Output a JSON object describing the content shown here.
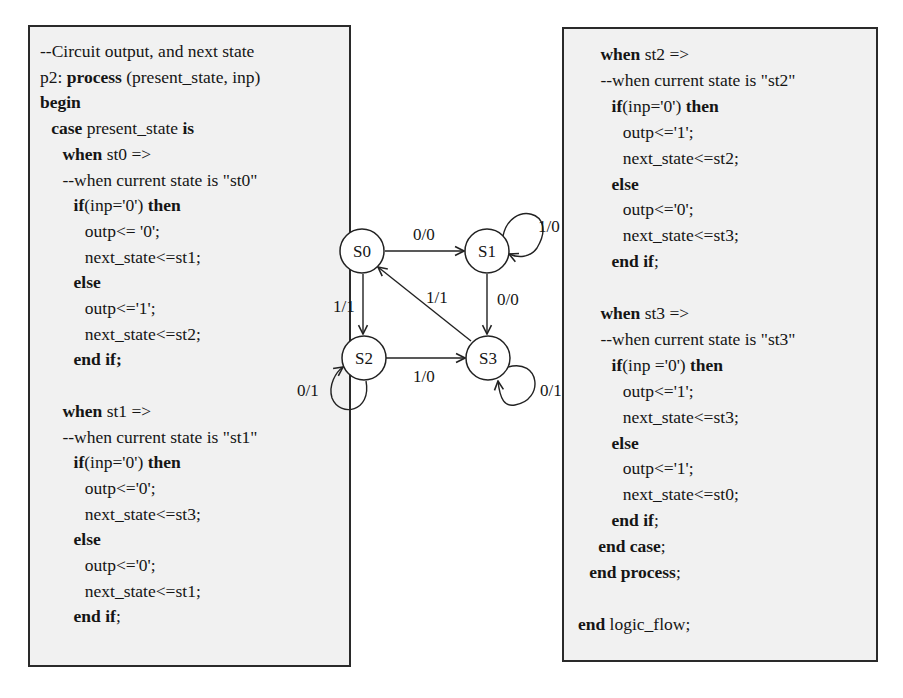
{
  "left_code": {
    "lines": [
      {
        "indent": 0,
        "parts": [
          {
            "t": "--Circuit output, and next state",
            "b": false
          }
        ]
      },
      {
        "indent": 0,
        "parts": [
          {
            "t": "p2: ",
            "b": false
          },
          {
            "t": "process",
            "b": true
          },
          {
            "t": " (present_state, inp)",
            "b": false
          }
        ]
      },
      {
        "indent": 0,
        "parts": [
          {
            "t": "begin",
            "b": true
          }
        ]
      },
      {
        "indent": 1,
        "parts": [
          {
            "t": "case",
            "b": true
          },
          {
            "t": " present_state ",
            "b": false
          },
          {
            "t": "is",
            "b": true
          }
        ]
      },
      {
        "indent": 2,
        "parts": [
          {
            "t": "when",
            "b": true
          },
          {
            "t": " st0 =>",
            "b": false
          }
        ]
      },
      {
        "indent": 2,
        "parts": [
          {
            "t": "--when current state is \"st0\"",
            "b": false
          }
        ]
      },
      {
        "indent": 3,
        "parts": [
          {
            "t": "if",
            "b": true
          },
          {
            "t": "(inp='0') ",
            "b": false
          },
          {
            "t": "then",
            "b": true
          }
        ]
      },
      {
        "indent": 4,
        "parts": [
          {
            "t": "outp<= '0';",
            "b": false
          }
        ]
      },
      {
        "indent": 4,
        "parts": [
          {
            "t": "next_state<=st1;",
            "b": false
          }
        ]
      },
      {
        "indent": 3,
        "parts": [
          {
            "t": "else",
            "b": true
          }
        ]
      },
      {
        "indent": 4,
        "parts": [
          {
            "t": "outp<='1';",
            "b": false
          }
        ]
      },
      {
        "indent": 4,
        "parts": [
          {
            "t": "next_state<=st2;",
            "b": false
          }
        ]
      },
      {
        "indent": 3,
        "parts": [
          {
            "t": "end if;",
            "b": true
          }
        ]
      },
      {
        "indent": 0,
        "parts": []
      },
      {
        "indent": 2,
        "parts": [
          {
            "t": "when",
            "b": true
          },
          {
            "t": " st1 =>",
            "b": false
          }
        ]
      },
      {
        "indent": 2,
        "parts": [
          {
            "t": "--when current state is \"st1\"",
            "b": false
          }
        ]
      },
      {
        "indent": 3,
        "parts": [
          {
            "t": "if",
            "b": true
          },
          {
            "t": "(inp='0') ",
            "b": false
          },
          {
            "t": "then",
            "b": true
          }
        ]
      },
      {
        "indent": 4,
        "parts": [
          {
            "t": "outp<='0';",
            "b": false
          }
        ]
      },
      {
        "indent": 4,
        "parts": [
          {
            "t": "next_state<=st3;",
            "b": false
          }
        ]
      },
      {
        "indent": 3,
        "parts": [
          {
            "t": "else",
            "b": true
          }
        ]
      },
      {
        "indent": 4,
        "parts": [
          {
            "t": "outp<='0';",
            "b": false
          }
        ]
      },
      {
        "indent": 4,
        "parts": [
          {
            "t": "next_state<=st1;",
            "b": false
          }
        ]
      },
      {
        "indent": 3,
        "parts": [
          {
            "t": "end if",
            "b": true
          },
          {
            "t": ";",
            "b": false
          }
        ]
      }
    ]
  },
  "right_code": {
    "lines": [
      {
        "indent": 2,
        "parts": [
          {
            "t": "when",
            "b": true
          },
          {
            "t": " st2 =>",
            "b": false
          }
        ]
      },
      {
        "indent": 2,
        "parts": [
          {
            "t": "--when current state is \"st2\"",
            "b": false
          }
        ]
      },
      {
        "indent": 3,
        "parts": [
          {
            "t": "if",
            "b": true
          },
          {
            "t": "(inp='0') ",
            "b": false
          },
          {
            "t": "then",
            "b": true
          }
        ]
      },
      {
        "indent": 4,
        "parts": [
          {
            "t": "outp<='1';",
            "b": false
          }
        ]
      },
      {
        "indent": 4,
        "parts": [
          {
            "t": "next_state<=st2;",
            "b": false
          }
        ]
      },
      {
        "indent": 3,
        "parts": [
          {
            "t": "else",
            "b": true
          }
        ]
      },
      {
        "indent": 4,
        "parts": [
          {
            "t": "outp<='0';",
            "b": false
          }
        ]
      },
      {
        "indent": 4,
        "parts": [
          {
            "t": "next_state<=st3;",
            "b": false
          }
        ]
      },
      {
        "indent": 3,
        "parts": [
          {
            "t": "end if",
            "b": true
          },
          {
            "t": ";",
            "b": false
          }
        ]
      },
      {
        "indent": 0,
        "parts": []
      },
      {
        "indent": 2,
        "parts": [
          {
            "t": "when",
            "b": true
          },
          {
            "t": " st3 =>",
            "b": false
          }
        ]
      },
      {
        "indent": 2,
        "parts": [
          {
            "t": "--when current state is \"st3\"",
            "b": false
          }
        ]
      },
      {
        "indent": 3,
        "parts": [
          {
            "t": "if",
            "b": true
          },
          {
            "t": "(inp ='0') ",
            "b": false
          },
          {
            "t": "then",
            "b": true
          }
        ]
      },
      {
        "indent": 4,
        "parts": [
          {
            "t": "outp<='1';",
            "b": false
          }
        ]
      },
      {
        "indent": 4,
        "parts": [
          {
            "t": "next_state<=st3;",
            "b": false
          }
        ]
      },
      {
        "indent": 3,
        "parts": [
          {
            "t": "else",
            "b": true
          }
        ]
      },
      {
        "indent": 4,
        "parts": [
          {
            "t": "outp<='1';",
            "b": false
          }
        ]
      },
      {
        "indent": 4,
        "parts": [
          {
            "t": "next_state<=st0;",
            "b": false
          }
        ]
      },
      {
        "indent": 3,
        "parts": [
          {
            "t": "end if",
            "b": true
          },
          {
            "t": ";",
            "b": false
          }
        ]
      },
      {
        "indent": 1.8,
        "parts": [
          {
            "t": "end case",
            "b": true
          },
          {
            "t": ";",
            "b": false
          }
        ]
      },
      {
        "indent": 1,
        "parts": [
          {
            "t": "end process",
            "b": true
          },
          {
            "t": ";",
            "b": false
          }
        ]
      },
      {
        "indent": 0,
        "parts": []
      },
      {
        "indent": 0,
        "parts": [
          {
            "t": "end",
            "b": true
          },
          {
            "t": " logic_flow;",
            "b": false
          }
        ]
      }
    ]
  },
  "fsm": {
    "states": [
      {
        "id": "S0",
        "label": "S0"
      },
      {
        "id": "S1",
        "label": "S1"
      },
      {
        "id": "S2",
        "label": "S2"
      },
      {
        "id": "S3",
        "label": "S3"
      }
    ],
    "transitions": [
      {
        "from": "S0",
        "to": "S1",
        "label": "0/0"
      },
      {
        "from": "S0",
        "to": "S2",
        "label": "1/1"
      },
      {
        "from": "S1",
        "to": "S1",
        "label": "1/0"
      },
      {
        "from": "S1",
        "to": "S3",
        "label": "0/0"
      },
      {
        "from": "S2",
        "to": "S2",
        "label": "0/1"
      },
      {
        "from": "S2",
        "to": "S3",
        "label": "1/0"
      },
      {
        "from": "S3",
        "to": "S3",
        "label": "0/1"
      },
      {
        "from": "S3",
        "to": "S0",
        "label": "1/1"
      }
    ]
  }
}
